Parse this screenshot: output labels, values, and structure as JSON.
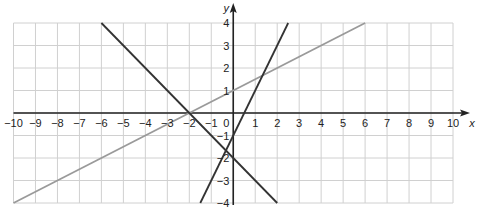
{
  "chart_data": {
    "type": "line",
    "title": "",
    "xlabel": "x",
    "ylabel": "y",
    "xlim": [
      -10,
      10
    ],
    "ylim": [
      -4,
      4
    ],
    "grid": true,
    "x_ticks": [
      -10,
      -9,
      -8,
      -7,
      -6,
      -5,
      -4,
      -3,
      -2,
      -1,
      1,
      2,
      3,
      4,
      5,
      6,
      7,
      8,
      9,
      10
    ],
    "y_ticks": [
      -4,
      -3,
      -2,
      -1,
      1,
      2,
      3,
      4
    ],
    "origin_label": "0",
    "series": [
      {
        "name": "y = 0.5x + 1",
        "color": "#9a9a9a",
        "x": [
          -10,
          6
        ],
        "y": [
          -4,
          4
        ]
      },
      {
        "name": "y = -x - 2",
        "color": "#333333",
        "x": [
          -6,
          2
        ],
        "y": [
          4,
          -4
        ]
      },
      {
        "name": "y = 2x - 1",
        "color": "#333333",
        "x": [
          -1.5,
          2.5
        ],
        "y": [
          -4,
          4
        ]
      }
    ]
  },
  "colors": {
    "grid": "#d0d0d0",
    "axis": "#222222"
  }
}
